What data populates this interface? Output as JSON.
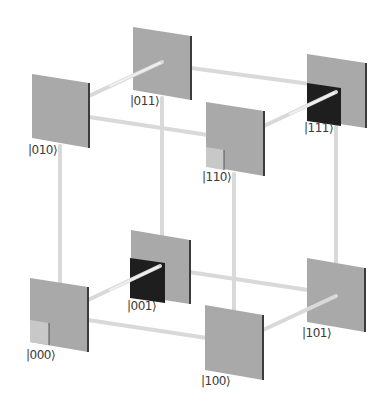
{
  "diagram": {
    "colors": {
      "plate": "#a9a9a9",
      "plate_edge": "#3c3c3c",
      "rod": "#d9d9d9",
      "rod_highlight": "#efefef",
      "dark_fill": "#1e1e1e",
      "light_fill": "#c8c8c8",
      "label": "#3a3a3a"
    },
    "states": [
      {
        "id": "000",
        "label": "|000⟩",
        "fill": "light"
      },
      {
        "id": "001",
        "label": "|001⟩",
        "fill": "dark"
      },
      {
        "id": "010",
        "label": "|010⟩",
        "fill": "none"
      },
      {
        "id": "011",
        "label": "|011⟩",
        "fill": "none"
      },
      {
        "id": "100",
        "label": "|100⟩",
        "fill": "none"
      },
      {
        "id": "101",
        "label": "|101⟩",
        "fill": "none"
      },
      {
        "id": "110",
        "label": "|110⟩",
        "fill": "light"
      },
      {
        "id": "111",
        "label": "|111⟩",
        "fill": "dark"
      }
    ],
    "edges": [
      [
        "000",
        "001"
      ],
      [
        "000",
        "010"
      ],
      [
        "000",
        "100"
      ],
      [
        "001",
        "011"
      ],
      [
        "001",
        "101"
      ],
      [
        "010",
        "011"
      ],
      [
        "010",
        "110"
      ],
      [
        "011",
        "111"
      ],
      [
        "100",
        "101"
      ],
      [
        "100",
        "110"
      ],
      [
        "101",
        "111"
      ],
      [
        "110",
        "111"
      ]
    ]
  }
}
